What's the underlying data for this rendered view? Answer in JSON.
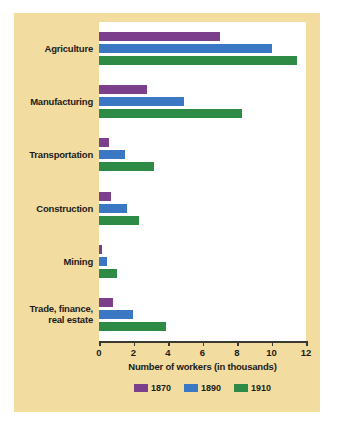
{
  "chart_data": {
    "type": "bar",
    "orientation": "horizontal",
    "title": "",
    "xlabel": "Number of workers (in thousands)",
    "ylabel": "",
    "xlim": [
      0,
      12
    ],
    "xticks": [
      0,
      2,
      4,
      6,
      8,
      10,
      12
    ],
    "grid": false,
    "legend_position": "bottom",
    "categories": [
      "Agriculture",
      "Manufacturing",
      "Transportation",
      "Construction",
      "Mining",
      "Trade, finance, real estate"
    ],
    "series": [
      {
        "name": "1870",
        "color": "#7b3f8c",
        "values": [
          7.0,
          2.8,
          0.6,
          0.7,
          0.2,
          0.8
        ]
      },
      {
        "name": "1890",
        "color": "#3b78c3",
        "values": [
          10.0,
          4.9,
          1.5,
          1.6,
          0.45,
          1.95
        ]
      },
      {
        "name": "1910",
        "color": "#2e8b45",
        "values": [
          11.5,
          8.3,
          3.2,
          2.3,
          1.05,
          3.9
        ]
      }
    ]
  },
  "axis": {
    "title": "Number of workers (in thousands)",
    "tick_labels": [
      "0",
      "2",
      "4",
      "6",
      "8",
      "10",
      "12"
    ]
  },
  "legend": {
    "items": [
      {
        "label": "1870",
        "color": "#7b3f8c"
      },
      {
        "label": "1890",
        "color": "#3b78c3"
      },
      {
        "label": "1910",
        "color": "#2e8b45"
      }
    ]
  },
  "labels": {
    "agriculture": "Agriculture",
    "manufacturing": "Manufacturing",
    "transportation": "Transportation",
    "construction": "Construction",
    "mining": "Mining",
    "trade_line1": "Trade, finance,",
    "trade_line2": "real estate"
  },
  "colors": {
    "panel_background": "#f3dc9f",
    "plot_background": "#ffffff",
    "axis": "#3a3a32",
    "text": "#1b1b1b"
  }
}
